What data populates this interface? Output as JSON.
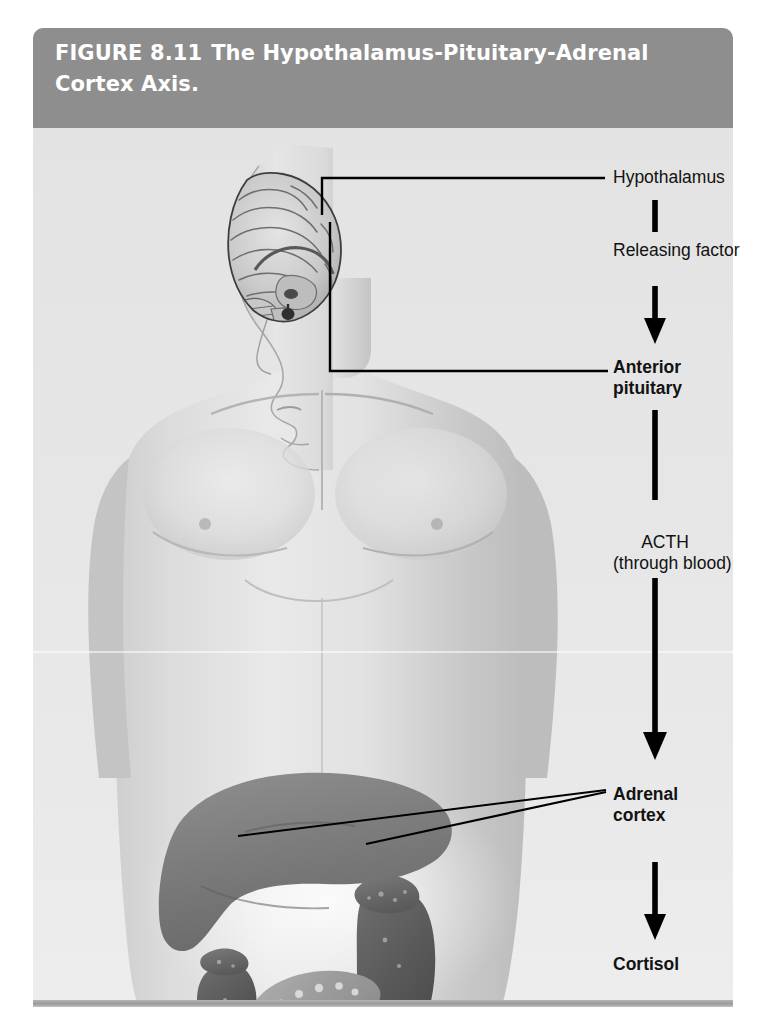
{
  "figure": {
    "number": "FIGURE 8.11",
    "title": "The Hypothalamus-Pituitary-Adrenal Cortex Axis.",
    "caption_line1_number": "FIGURE 8.11",
    "caption_line1_text": "The Hypothalamus-Pituitary-Adrenal",
    "caption_line2_text": "Cortex Axis."
  },
  "colors": {
    "caption_band": "#8e8e8e",
    "caption_text": "#ffffff",
    "panel_background": "#e7e7e7",
    "label_text": "#121212",
    "leader_line": "#000000",
    "bottom_rule": "#a6a6a6"
  },
  "flow": {
    "steps": [
      {
        "id": "hypothalamus",
        "label": "Hypothalamus",
        "bold": false,
        "kind": "organ"
      },
      {
        "id": "releasing-factor",
        "label": "Releasing factor",
        "bold": false,
        "kind": "signal"
      },
      {
        "id": "anterior-pituitary",
        "label": "Anterior\npituitary",
        "bold": true,
        "kind": "organ"
      },
      {
        "id": "acth",
        "label": "ACTH\n(through blood)",
        "bold": false,
        "kind": "signal"
      },
      {
        "id": "adrenal-cortex",
        "label": "Adrenal\ncortex",
        "bold": true,
        "kind": "organ"
      },
      {
        "id": "cortisol",
        "label": "Cortisol",
        "bold": true,
        "kind": "hormone"
      }
    ]
  },
  "labels": {
    "hypothalamus": "Hypothalamus",
    "releasing_factor": "Releasing factor",
    "anterior_pituitary_line1": "Anterior",
    "anterior_pituitary_line2": "pituitary",
    "acth_line1": "ACTH",
    "acth_line2": "(through blood)",
    "adrenal_cortex_line1": "Adrenal",
    "adrenal_cortex_line2": "cortex",
    "cortisol": "Cortisol"
  },
  "anatomy": {
    "subject": "human-male-torso-photograph",
    "structures": [
      {
        "name": "brain-sagittal-section",
        "pointed_to_by": "hypothalamus"
      },
      {
        "name": "pituitary-gland",
        "pointed_to_by": "anterior-pituitary"
      },
      {
        "name": "liver",
        "pointed_to_by": null
      },
      {
        "name": "left-kidney",
        "pointed_to_by": null
      },
      {
        "name": "right-kidney",
        "pointed_to_by": null
      },
      {
        "name": "left-adrenal-gland",
        "pointed_to_by": "adrenal-cortex"
      },
      {
        "name": "right-adrenal-gland",
        "pointed_to_by": "adrenal-cortex"
      },
      {
        "name": "pancreas",
        "pointed_to_by": null
      }
    ]
  }
}
